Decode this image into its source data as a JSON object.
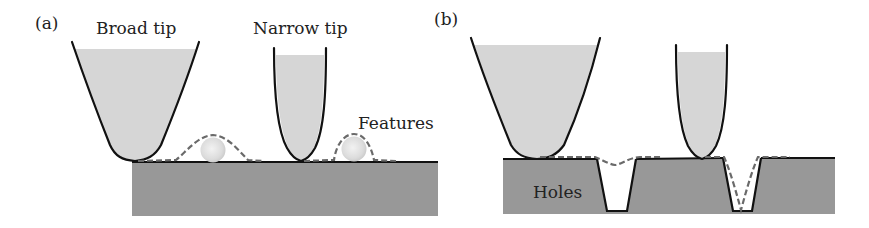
{
  "figure": {
    "colors": {
      "tip_fill": "#d6d6d6",
      "substrate": "#989898",
      "outline": "#111111",
      "trace": "#6a6a6a",
      "feature": "#e4e4e4",
      "background": "#ffffff"
    },
    "panel_a": {
      "label": "(a)",
      "broad_tip_label": "Broad tip",
      "narrow_tip_label": "Narrow tip",
      "features_label": "Features"
    },
    "panel_b": {
      "label": "(b)",
      "holes_label": "Holes"
    }
  }
}
